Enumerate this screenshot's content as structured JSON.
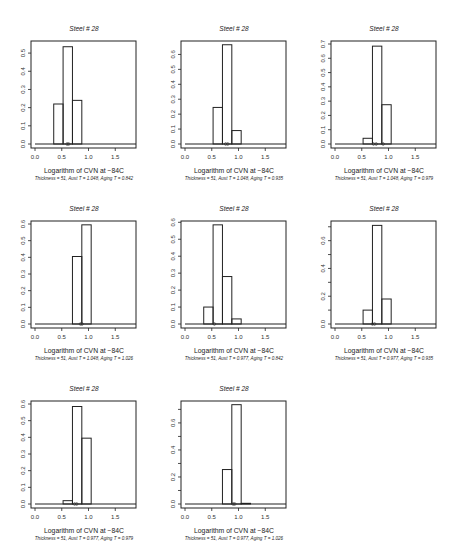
{
  "chart_data": [
    {
      "type": "bar",
      "title": "Steel # 28",
      "xlabel": "Logarithm of CVN at −84C",
      "subtitle": "Thickness = 51, Aust T = 1.048, Aging T = 0.842",
      "xlim": [
        0,
        1.85
      ],
      "xticks": [
        0.0,
        0.5,
        1.0,
        1.5
      ],
      "ylim": [
        0,
        0.55
      ],
      "yticks": [
        0.0,
        0.1,
        0.2,
        0.3,
        0.4,
        0.5
      ],
      "yticklabels": [
        "0.0",
        "0.1",
        "0.2",
        "0.3",
        "0.4",
        "0.5"
      ],
      "bins": [
        [
          0.35,
          0.525,
          0.22
        ],
        [
          0.525,
          0.7,
          0.535
        ],
        [
          0.7,
          0.875,
          0.24
        ]
      ],
      "markers": [
        0.6,
        0.63
      ]
    },
    {
      "type": "bar",
      "title": "Steel # 28",
      "xlabel": "Logarithm of CVN at −84C",
      "subtitle": "Thickness = 51, Aust T = 1.048, Aging T = 0.935",
      "xlim": [
        0,
        1.85
      ],
      "xticks": [
        0.0,
        0.5,
        1.0,
        1.5
      ],
      "ylim": [
        0,
        0.67
      ],
      "yticks": [
        0.0,
        0.1,
        0.2,
        0.3,
        0.4,
        0.5,
        0.6
      ],
      "yticklabels": [
        "0.0",
        "0.1",
        "0.2",
        "0.3",
        "0.4",
        "0.5",
        "0.6"
      ],
      "bins": [
        [
          0.525,
          0.7,
          0.245
        ],
        [
          0.7,
          0.875,
          0.665
        ],
        [
          0.875,
          1.05,
          0.09
        ]
      ],
      "markers": [
        0.76,
        0.8
      ]
    },
    {
      "type": "bar",
      "title": "Steel # 28",
      "xlabel": "Logarithm of CVN at −84C",
      "subtitle": "Thickness = 51, Aust T = 1.048, Aging T = 0.979",
      "xlim": [
        0,
        1.85
      ],
      "xticks": [
        0.0,
        0.5,
        1.0,
        1.5
      ],
      "ylim": [
        0,
        0.7
      ],
      "yticks": [
        0.0,
        0.1,
        0.2,
        0.3,
        0.4,
        0.5,
        0.6,
        0.7
      ],
      "yticklabels": [
        "0.0",
        "0.1",
        "0.2",
        "0.3",
        "0.4",
        "0.5",
        "0.6",
        "0.7"
      ],
      "bins": [
        [
          0.525,
          0.7,
          0.04
        ],
        [
          0.7,
          0.875,
          0.685
        ],
        [
          0.875,
          1.05,
          0.275
        ]
      ],
      "markers": [
        0.72,
        0.77,
        0.9
      ]
    },
    {
      "type": "bar",
      "title": "Steel # 28",
      "xlabel": "Logarithm of CVN at −84C",
      "subtitle": "Thickness = 51, Aust T = 1.048, Aging T = 1.026",
      "xlim": [
        0,
        1.85
      ],
      "xticks": [
        0.0,
        0.5,
        1.0,
        1.5
      ],
      "ylim": [
        0,
        0.6
      ],
      "yticks": [
        0.0,
        0.1,
        0.2,
        0.3,
        0.4,
        0.5,
        0.6
      ],
      "yticklabels": [
        "0.0",
        "0.1",
        "0.2",
        "0.3",
        "0.4",
        "0.5",
        "0.6"
      ],
      "bins": [
        [
          0.7,
          0.875,
          0.405
        ],
        [
          0.875,
          1.05,
          0.595
        ]
      ],
      "markers": [
        0.85,
        0.88
      ]
    },
    {
      "type": "bar",
      "title": "Steel # 28",
      "xlabel": "Logarithm of CVN at −84C",
      "subtitle": "Thickness = 51, Aust T = 0.977, Aging T = 0.842",
      "xlim": [
        0,
        1.85
      ],
      "xticks": [
        0.0,
        0.5,
        1.0,
        1.5
      ],
      "ylim": [
        0,
        0.59
      ],
      "yticks": [
        0.0,
        0.1,
        0.2,
        0.3,
        0.4,
        0.5,
        0.6
      ],
      "yticklabels": [
        "0.0",
        "0.1",
        "0.2",
        "0.3",
        "0.4",
        "0.5",
        "0.6"
      ],
      "bins": [
        [
          0.35,
          0.525,
          0.1
        ],
        [
          0.525,
          0.7,
          0.585
        ],
        [
          0.7,
          0.875,
          0.28
        ],
        [
          0.875,
          1.05,
          0.03
        ]
      ],
      "markers": [
        0.55
      ]
    },
    {
      "type": "bar",
      "title": "Steel # 28",
      "xlabel": "Logarithm of CVN at −84C",
      "subtitle": "Thickness = 51, Aust T = 0.977, Aging T = 0.935",
      "xlim": [
        0,
        1.85
      ],
      "xticks": [
        0.0,
        0.5,
        1.0,
        1.5
      ],
      "ylim": [
        0,
        0.72
      ],
      "yticks": [
        0.0,
        0.1,
        0.2,
        0.3,
        0.4,
        0.5,
        0.6,
        0.7
      ],
      "yticklabels": [
        "0.0",
        "",
        "0.2",
        "",
        "0.4",
        "",
        "0.6",
        ""
      ],
      "bins": [
        [
          0.525,
          0.7,
          0.1
        ],
        [
          0.7,
          0.875,
          0.71
        ],
        [
          0.875,
          1.05,
          0.18
        ]
      ],
      "markers": [
        0.7,
        0.74
      ]
    },
    {
      "type": "bar",
      "title": "Steel # 28",
      "xlabel": "Logarithm of CVN at −84C",
      "subtitle": "Thickness = 51, Aust T = 0.977, Aging T = 0.979",
      "xlim": [
        0,
        1.85
      ],
      "xticks": [
        0.0,
        0.5,
        1.0,
        1.5
      ],
      "ylim": [
        0,
        0.6
      ],
      "yticks": [
        0.0,
        0.1,
        0.2,
        0.3,
        0.4,
        0.5,
        0.6
      ],
      "yticklabels": [
        "0.0",
        "0.1",
        "0.2",
        "0.3",
        "0.4",
        "0.5",
        "0.6"
      ],
      "bins": [
        [
          0.525,
          0.7,
          0.02
        ],
        [
          0.7,
          0.875,
          0.585
        ],
        [
          0.875,
          1.05,
          0.395
        ]
      ],
      "markers": [
        0.74,
        0.78
      ]
    },
    {
      "type": "bar",
      "title": "Steel # 28",
      "xlabel": "Logarithm of CVN at −84C",
      "subtitle": "Thickness = 51, Aust T = 0.977, Aging T = 1.026",
      "xlim": [
        0,
        1.85
      ],
      "xticks": [
        0.0,
        0.5,
        1.0,
        1.5
      ],
      "ylim": [
        0,
        0.74
      ],
      "yticks": [
        0.0,
        0.1,
        0.2,
        0.3,
        0.4,
        0.5,
        0.6,
        0.7
      ],
      "yticklabels": [
        "0.0",
        "",
        "0.2",
        "",
        "0.4",
        "",
        "0.6",
        ""
      ],
      "bins": [
        [
          0.7,
          0.875,
          0.255
        ],
        [
          0.875,
          1.05,
          0.735
        ],
        [
          1.05,
          1.225,
          0.005
        ]
      ],
      "markers": [
        0.9,
        0.93
      ]
    }
  ],
  "layout": {
    "panel_origins": [
      [
        0,
        0
      ],
      [
        150,
        0
      ],
      [
        300,
        0
      ],
      [
        0,
        180
      ],
      [
        150,
        180
      ],
      [
        300,
        180
      ],
      [
        0,
        360
      ],
      [
        150,
        360
      ]
    ]
  }
}
